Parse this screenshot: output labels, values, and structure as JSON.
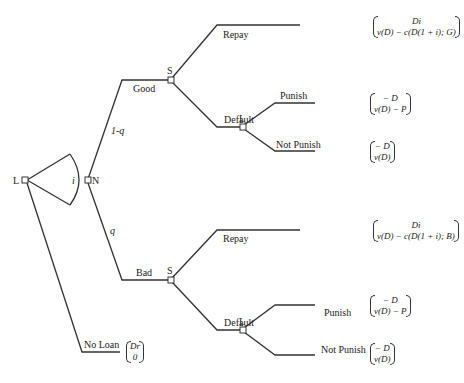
{
  "nodes": {
    "lender_root": "L",
    "nature": "N",
    "sovereign_good": "S",
    "sovereign_bad": "S",
    "lender_good_default": "L",
    "lender_bad_default": "L"
  },
  "interest_label": "i",
  "branches": {
    "good": "Good",
    "bad": "Bad",
    "prob_good": "1-q",
    "prob_bad": "q",
    "no_loan": "No Loan",
    "good_repay": "Repay",
    "good_default": "Default",
    "good_punish": "Punish",
    "good_not_punish": "Not Punish",
    "bad_repay": "Repay",
    "bad_default": "Default",
    "bad_punish": "Punish",
    "bad_not_punish": "Not Punish"
  },
  "payoffs": {
    "good_repay": {
      "top": "Di",
      "bottom": "v(D) − c(D(1 + i); G)"
    },
    "good_punish": {
      "top": "− D",
      "bottom": "v(D) − P"
    },
    "good_not_punish": {
      "top": "− D",
      "bottom": "v(D)"
    },
    "bad_repay": {
      "top": "Di",
      "bottom": "v(D) − c(D(1 + i); B)"
    },
    "bad_punish": {
      "top": "− D",
      "bottom": "v(D) − P"
    },
    "bad_not_punish": {
      "top": "− D",
      "bottom": "v(D)"
    },
    "no_loan": {
      "top": "Dr",
      "bottom": "0"
    }
  },
  "colors": {
    "line": "#333333",
    "text": "#222222"
  }
}
